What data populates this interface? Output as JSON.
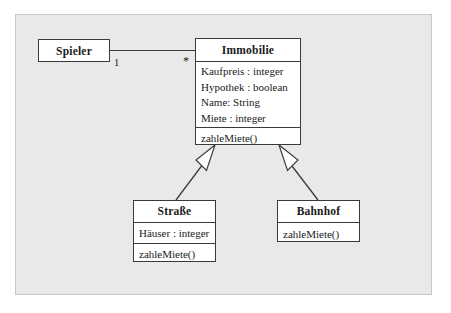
{
  "diagram": {
    "type": "uml-class-diagram",
    "background_color": "#e9e9e9",
    "line_color": "#3a3a3a",
    "box_fill": "#ffffff"
  },
  "classes": {
    "spieler": {
      "name": "Spieler",
      "attributes": [],
      "methods": []
    },
    "immobilie": {
      "name": "Immobilie",
      "attributes": [
        "Kaufpreis : integer",
        "Hypothek : boolean",
        "Name: String",
        "Miete : integer"
      ],
      "methods": [
        "zahleMiete()"
      ]
    },
    "strasse": {
      "name": "Straße",
      "attributes": [
        "Häuser : integer"
      ],
      "methods": [
        "zahleMiete()"
      ]
    },
    "bahnhof": {
      "name": "Bahnhof",
      "attributes": [],
      "methods": [
        "zahleMiete()"
      ]
    }
  },
  "association": {
    "from": "Spieler",
    "to": "Immobilie",
    "multiplicity_source": "1",
    "multiplicity_target": "*"
  },
  "generalizations": [
    {
      "subclass": "Straße",
      "superclass": "Immobilie"
    },
    {
      "subclass": "Bahnhof",
      "superclass": "Immobilie"
    }
  ]
}
